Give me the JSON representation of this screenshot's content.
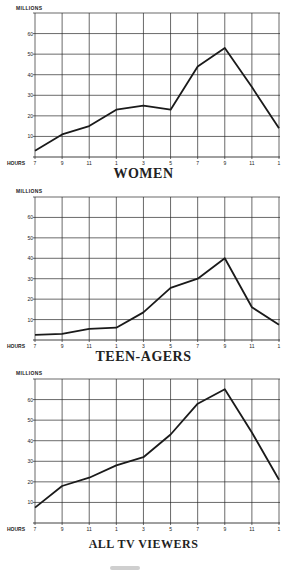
{
  "chart_data": [
    {
      "type": "line",
      "title": "WOMEN",
      "ylabel": "MILLIONS",
      "xlabel": "HOURS",
      "categories": [
        "7",
        "9",
        "11",
        "1",
        "3",
        "5",
        "7",
        "9",
        "11",
        "1"
      ],
      "series": [
        {
          "name": "Women",
          "values": [
            3,
            11,
            15,
            23,
            25,
            23,
            44,
            53,
            34,
            14
          ]
        }
      ],
      "yticks": [
        10,
        20,
        30,
        40,
        50,
        60
      ],
      "ylim": [
        0,
        70
      ],
      "grid": true
    },
    {
      "type": "line",
      "title": "TEEN-AGERS",
      "ylabel": "MILLIONS",
      "xlabel": "HOURS",
      "categories": [
        "7",
        "9",
        "11",
        "1",
        "3",
        "5",
        "7",
        "9",
        "11",
        "1"
      ],
      "series": [
        {
          "name": "Teen-agers",
          "values": [
            2.5,
            3,
            5.5,
            6,
            13.5,
            25.5,
            30,
            40,
            16,
            7.5
          ]
        }
      ],
      "yticks": [
        10,
        20,
        30,
        40,
        50,
        60
      ],
      "ylim": [
        0,
        70
      ],
      "grid": true
    },
    {
      "type": "line",
      "title": "ALL TV VIEWERS",
      "ylabel": "MILLIONS",
      "xlabel": "HOURS",
      "categories": [
        "7",
        "9",
        "11",
        "1",
        "3",
        "5",
        "7",
        "9",
        "11",
        "1"
      ],
      "series": [
        {
          "name": "All TV viewers",
          "values": [
            7.5,
            18,
            22,
            28,
            32,
            43,
            58,
            65,
            44,
            21
          ]
        }
      ],
      "yticks": [
        10,
        20,
        30,
        40,
        50,
        60
      ],
      "ylim": [
        0,
        70
      ],
      "grid": true
    }
  ],
  "labels": {
    "millions": "MILLIONS",
    "hours": "HOURS"
  },
  "style": {
    "line_color": "#1a1a1a",
    "grid_color": "#2a2a2a"
  }
}
